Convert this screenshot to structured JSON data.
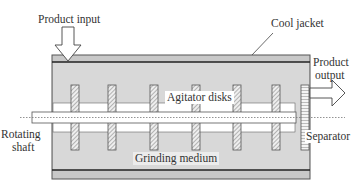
{
  "diagram": {
    "labels": {
      "product_input": "Product input",
      "cool_jacket": "Cool jacket",
      "product_output_line1": "Product",
      "product_output_line2": "output",
      "agitator_disks": "Agitator disks",
      "rotating_shaft_line1": "Rotating",
      "rotating_shaft_line2": "shaft",
      "separator": "Separator",
      "grinding_medium": "Grinding medium"
    },
    "colors": {
      "jacket": "#c8c8c8",
      "chamber": "#d9d9d9",
      "outline": "#333333",
      "shaft": "#ffffff"
    },
    "disk_count": 6
  }
}
